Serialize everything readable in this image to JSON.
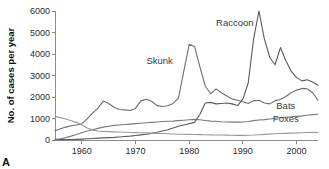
{
  "figure": {
    "panel_letter": "A"
  },
  "chart_data": {
    "type": "line",
    "title": "",
    "xlabel": "",
    "ylabel": "No. of cases per year",
    "xlim": [
      1955,
      2004
    ],
    "ylim": [
      0,
      6000
    ],
    "grid": false,
    "legend_position": "inline-annotations",
    "x_ticks": [
      1960,
      1970,
      1980,
      1990,
      2000
    ],
    "y_ticks": [
      0,
      1000,
      2000,
      3000,
      4000,
      5000,
      6000
    ],
    "x": [
      1955,
      1956,
      1957,
      1958,
      1959,
      1960,
      1961,
      1962,
      1963,
      1964,
      1965,
      1966,
      1967,
      1968,
      1969,
      1970,
      1971,
      1972,
      1973,
      1974,
      1975,
      1976,
      1977,
      1978,
      1979,
      1980,
      1981,
      1982,
      1983,
      1984,
      1985,
      1986,
      1987,
      1988,
      1989,
      1990,
      1991,
      1992,
      1993,
      1994,
      1995,
      1996,
      1997,
      1998,
      1999,
      2000,
      2001,
      2002,
      2003,
      2004
    ],
    "series": [
      {
        "name": "Skunk",
        "color": "#6e6e6e",
        "label": "Skunk",
        "label_x": 1974.5,
        "label_y": 3550,
        "values": [
          430,
          520,
          600,
          660,
          700,
          760,
          980,
          1250,
          1480,
          1810,
          1700,
          1520,
          1420,
          1400,
          1370,
          1470,
          1820,
          1900,
          1800,
          1600,
          1560,
          1590,
          1700,
          1950,
          3200,
          4450,
          4350,
          3400,
          2500,
          2150,
          2380,
          2200,
          2050,
          1900,
          1850,
          1780,
          1700,
          1820,
          1850,
          1720,
          1680,
          1830,
          1880,
          2020,
          2200,
          2320,
          2400,
          2380,
          2200,
          1850
        ]
      },
      {
        "name": "Raccoon",
        "color": "#5a5a5a",
        "label": "Raccoon",
        "label_x": 1988.5,
        "label_y": 5300,
        "values": [
          15,
          18,
          20,
          25,
          30,
          40,
          55,
          70,
          85,
          100,
          110,
          120,
          140,
          160,
          180,
          210,
          240,
          270,
          310,
          360,
          420,
          480,
          560,
          640,
          700,
          760,
          820,
          1200,
          1720,
          1750,
          1680,
          1700,
          1720,
          1680,
          1600,
          1900,
          2650,
          4700,
          6000,
          4700,
          3850,
          3500,
          4300,
          3700,
          3200,
          2900,
          2750,
          2800,
          2700,
          2550
        ]
      },
      {
        "name": "Bats",
        "color": "#7a7a7a",
        "label": "Bats",
        "label_x": 1998.0,
        "label_y": 1460,
        "values": [
          30,
          60,
          110,
          180,
          260,
          340,
          420,
          480,
          540,
          600,
          640,
          680,
          700,
          720,
          740,
          760,
          780,
          800,
          820,
          840,
          860,
          870,
          880,
          900,
          920,
          940,
          960,
          940,
          910,
          880,
          870,
          850,
          840,
          830,
          830,
          840,
          860,
          900,
          930,
          950,
          980,
          1010,
          1040,
          1060,
          1080,
          1100,
          1120,
          1150,
          1180,
          1200
        ]
      },
      {
        "name": "Foxes",
        "color": "#9a9a9a",
        "label": "Foxes",
        "label_x": 1998.0,
        "label_y": 860,
        "values": [
          1100,
          1040,
          980,
          900,
          820,
          700,
          560,
          460,
          420,
          400,
          390,
          380,
          370,
          360,
          350,
          345,
          340,
          330,
          320,
          310,
          300,
          290,
          280,
          270,
          265,
          260,
          255,
          250,
          245,
          240,
          235,
          230,
          225,
          220,
          215,
          215,
          220,
          230,
          245,
          260,
          275,
          290,
          300,
          310,
          320,
          330,
          340,
          350,
          355,
          350
        ]
      }
    ]
  }
}
